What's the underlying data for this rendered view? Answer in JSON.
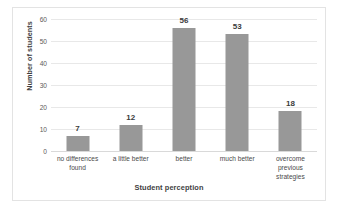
{
  "chart_data": {
    "type": "bar",
    "title": "",
    "xlabel": "Student perception",
    "ylabel": "Number of students",
    "categories": [
      "no differences found",
      "a little better",
      "better",
      "much better",
      "overcome previous strategies"
    ],
    "values": [
      7,
      12,
      56,
      53,
      18
    ],
    "data_labels": [
      "7",
      "12",
      "56",
      "53",
      "18"
    ],
    "ylim": [
      0,
      60
    ],
    "yticks": [
      0,
      10,
      20,
      30,
      40,
      50,
      60
    ],
    "ytick_labels": [
      "0",
      "10",
      "20",
      "30",
      "40",
      "50",
      "60"
    ],
    "grid": true,
    "legend": false,
    "bar_color": "#989898",
    "gridline_color": "#e8e8e8",
    "axis_text_color": "#5a5a5a",
    "title_text_color": "#3f3f3f",
    "plot_background": "#ffffff",
    "frame_border_color": "#e3e3e3"
  }
}
